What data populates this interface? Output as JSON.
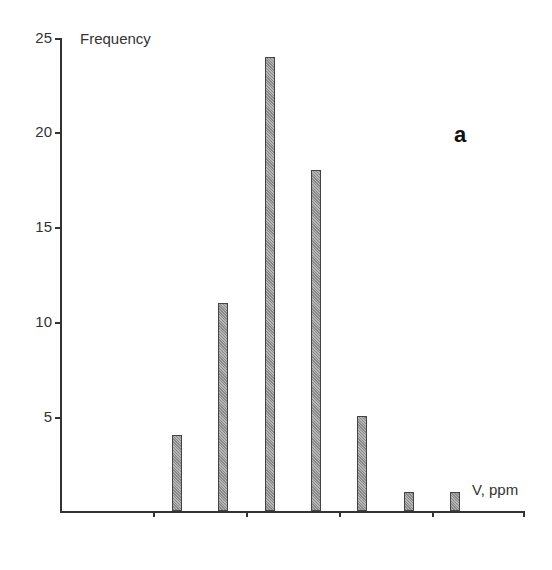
{
  "chart_data": {
    "type": "bar",
    "title": "",
    "panel_label": "a",
    "ylabel": "Frequency",
    "xlabel": "V, ppm",
    "ylim": [
      0,
      25
    ],
    "yticks": [
      5,
      10,
      15,
      20,
      25
    ],
    "xtick_labels": [],
    "grid": false,
    "categories": [
      "bin1",
      "bin2",
      "bin3",
      "bin4",
      "bin5",
      "bin6",
      "bin7"
    ],
    "values": [
      4,
      11,
      24,
      18,
      5,
      1,
      1
    ]
  },
  "labels": {
    "y5": "5",
    "y10": "10",
    "y15": "15",
    "y20": "20",
    "y25": "25"
  }
}
